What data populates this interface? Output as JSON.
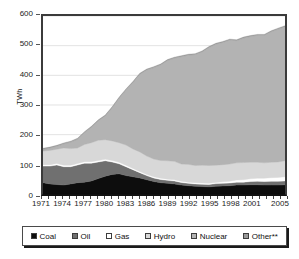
{
  "chart_data": {
    "type": "area",
    "stacked": true,
    "title": "",
    "xlabel": "",
    "ylabel": "TWh",
    "ylim": [
      0,
      600
    ],
    "ytick_values": [
      0,
      100,
      200,
      300,
      400,
      500,
      600
    ],
    "ytick_labels": [
      "0",
      "100",
      "200",
      "300",
      "400",
      "500",
      "600"
    ],
    "grid": true,
    "legend_position": "bottom",
    "x": [
      1971,
      1972,
      1973,
      1974,
      1975,
      1976,
      1977,
      1978,
      1979,
      1980,
      1981,
      1982,
      1983,
      1984,
      1985,
      1986,
      1987,
      1988,
      1989,
      1990,
      1991,
      1992,
      1993,
      1994,
      1995,
      1996,
      1997,
      1998,
      1999,
      2000,
      2001,
      2002,
      2003,
      2004,
      2005,
      2006
    ],
    "xtick_labels": [
      "1971",
      "1974",
      "1977",
      "1980",
      "1983",
      "1986",
      "1989",
      "1992",
      "1995",
      "1998",
      "2001",
      "2005"
    ],
    "xtick_values": [
      1971,
      1974,
      1977,
      1980,
      1983,
      1986,
      1989,
      1992,
      1995,
      1998,
      2001,
      2005
    ],
    "series": [
      {
        "name": "Coal",
        "color": "#0d0d0d",
        "values": [
          38,
          34,
          32,
          30,
          34,
          38,
          40,
          44,
          52,
          60,
          66,
          68,
          62,
          58,
          54,
          48,
          42,
          38,
          36,
          34,
          30,
          28,
          26,
          25,
          24,
          26,
          27,
          28,
          30,
          30,
          31,
          31,
          30,
          30,
          30,
          31
        ]
      },
      {
        "name": "Oil",
        "color": "#707070",
        "values": [
          56,
          60,
          66,
          62,
          58,
          60,
          64,
          60,
          56,
          52,
          42,
          34,
          30,
          24,
          18,
          14,
          12,
          11,
          10,
          10,
          9,
          8,
          8,
          8,
          8,
          9,
          9,
          9,
          10,
          10,
          11,
          12,
          12,
          13,
          13,
          13
        ]
      },
      {
        "name": "Gas",
        "color": "#ffffff",
        "values": [
          5,
          5,
          5,
          5,
          5,
          5,
          5,
          5,
          5,
          5,
          5,
          5,
          5,
          4,
          4,
          4,
          4,
          4,
          4,
          4,
          4,
          4,
          4,
          4,
          4,
          4,
          5,
          6,
          7,
          8,
          9,
          10,
          11,
          12,
          13,
          14
        ]
      },
      {
        "name": "Hydro",
        "color": "#d8d8d8",
        "values": [
          46,
          48,
          48,
          58,
          56,
          52,
          58,
          64,
          68,
          66,
          66,
          66,
          68,
          66,
          66,
          62,
          60,
          60,
          62,
          62,
          58,
          60,
          58,
          60,
          60,
          58,
          58,
          58,
          58,
          58,
          56,
          54,
          52,
          52,
          52,
          54
        ]
      },
      {
        "name": "Nuclear",
        "color": "#b3b3b3",
        "values": [
          6,
          8,
          10,
          14,
          22,
          30,
          40,
          52,
          66,
          80,
          112,
          150,
          186,
          224,
          262,
          290,
          308,
          322,
          338,
          348,
          362,
          368,
          374,
          382,
          398,
          408,
          412,
          418,
          412,
          420,
          424,
          428,
          430,
          440,
          448,
          452
        ]
      },
      {
        "name": "Other**",
        "color": "#9a9a9a",
        "values": [
          3,
          3,
          3,
          3,
          3,
          3,
          3,
          3,
          3,
          3,
          3,
          3,
          3,
          3,
          3,
          3,
          3,
          3,
          3,
          3,
          3,
          3,
          3,
          3,
          3,
          3,
          3,
          3,
          3,
          3,
          3,
          3,
          3,
          3,
          3,
          3
        ]
      }
    ],
    "totals": [
      154,
      158,
      164,
      172,
      178,
      188,
      210,
      228,
      250,
      266,
      294,
      326,
      354,
      379,
      407,
      421,
      429,
      438,
      453,
      461,
      466,
      471,
      473,
      482,
      497,
      508,
      514,
      522,
      520,
      529,
      534,
      538,
      538,
      550,
      559,
      567
    ]
  },
  "legend": {
    "items": [
      {
        "label": "Coal",
        "color": "#0d0d0d"
      },
      {
        "label": "Oil",
        "color": "#707070"
      },
      {
        "label": "Gas",
        "color": "#ffffff"
      },
      {
        "label": "Hydro",
        "color": "#d8d8d8"
      },
      {
        "label": "Nuclear",
        "color": "#b3b3b3"
      },
      {
        "label": "Other**",
        "color": "#9a9a9a"
      }
    ]
  }
}
